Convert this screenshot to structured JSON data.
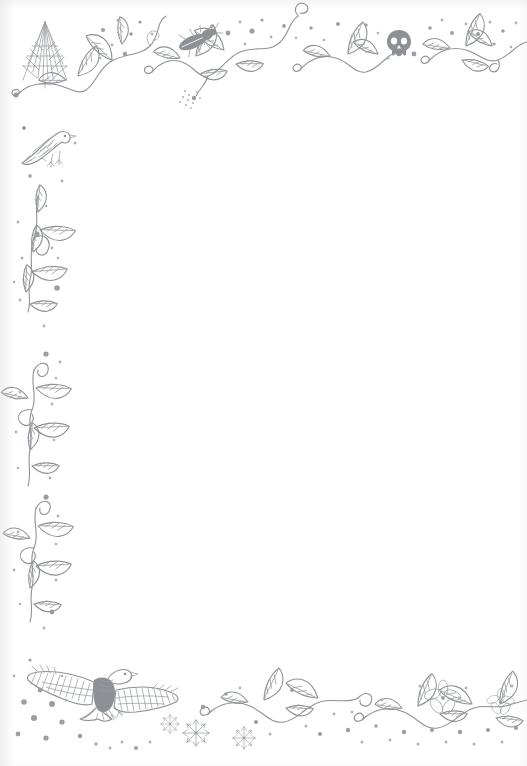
{
  "document": {
    "kind": "decorative-bordered-stationery-page",
    "title": "",
    "body_text": "",
    "page_width": 527,
    "page_height": 766,
    "orientation": "portrait"
  },
  "colors": {
    "paper": "#ffffff",
    "ink": "#8f9296",
    "ink_light": "#aeb1b5",
    "ink_fill": "#8d9095"
  },
  "border": {
    "style": "hand-drawn-ink-illustration",
    "description": "Leafy vine border along top, left and bottom edges with scattered dots and nature motifs",
    "edges_decorated": [
      "top",
      "left",
      "bottom"
    ],
    "edges_plain": [
      "right"
    ]
  },
  "motifs": [
    {
      "name": "pine-tree",
      "label": "Pine tree",
      "position": "top-left",
      "x": 45,
      "y": 62
    },
    {
      "name": "songbird",
      "label": "Perched songbird",
      "position": "upper-left",
      "x": 48,
      "y": 150
    },
    {
      "name": "beetle",
      "label": "Beetle",
      "position": "top",
      "x": 193,
      "y": 42
    },
    {
      "name": "skull",
      "label": "Skull",
      "position": "top-right",
      "x": 399,
      "y": 41
    },
    {
      "name": "eagle",
      "label": "Flying eagle",
      "position": "bottom-left",
      "x": 100,
      "y": 688
    },
    {
      "name": "snowflake",
      "label": "Snowflake",
      "position": "bottom",
      "x": 196,
      "y": 733
    },
    {
      "name": "snowflake",
      "label": "Snowflake",
      "position": "bottom",
      "x": 244,
      "y": 738
    },
    {
      "name": "flower",
      "label": "Flower",
      "position": "bottom-right",
      "x": 443,
      "y": 699
    },
    {
      "name": "flower",
      "label": "Flower",
      "position": "bottom-right",
      "x": 501,
      "y": 703
    },
    {
      "name": "leafy-vine",
      "label": "Leafy vine",
      "position": "top-border"
    },
    {
      "name": "leafy-vine",
      "label": "Leafy vine",
      "position": "left-border"
    },
    {
      "name": "leafy-vine",
      "label": "Leafy vine",
      "position": "bottom-border"
    },
    {
      "name": "scattered-dots",
      "label": "Scattered dots",
      "position": "all-borders"
    }
  ],
  "content_area": {
    "label": "Blank writing area",
    "placeholder": "",
    "text": ""
  }
}
